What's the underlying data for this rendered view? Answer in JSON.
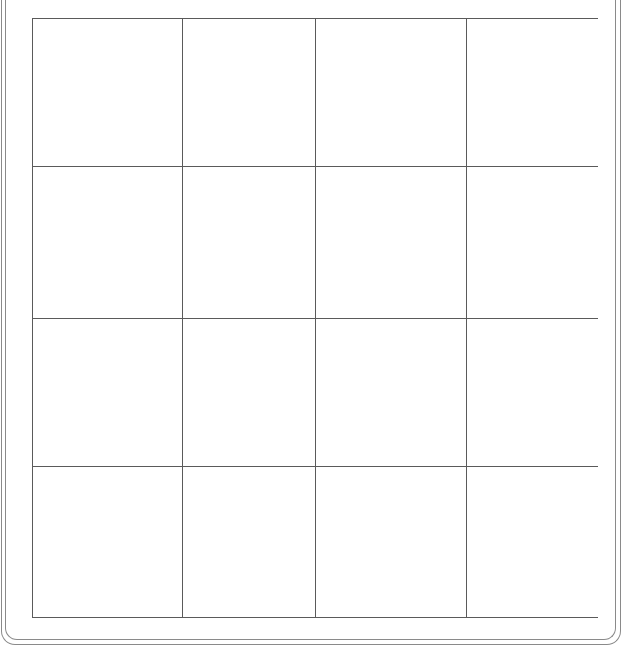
{
  "board": {
    "rows": 4,
    "cols": 4,
    "line_color": "#5a5a5a",
    "frame_color": "#8a8a8a",
    "cells": [
      [
        "",
        "",
        "",
        ""
      ],
      [
        "",
        "",
        "",
        ""
      ],
      [
        "",
        "",
        "",
        ""
      ],
      [
        "",
        "",
        "",
        ""
      ]
    ]
  }
}
